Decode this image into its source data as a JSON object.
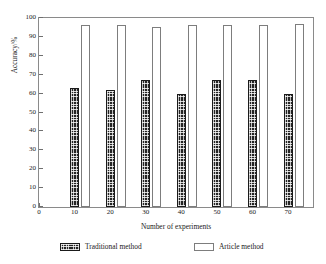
{
  "chart_data": {
    "type": "bar",
    "title": "",
    "subtitle": "",
    "xlabel": "Number of experiments",
    "ylabel": "Accuracy/%",
    "categories": [
      "10",
      "20",
      "30",
      "40",
      "50",
      "60",
      "70"
    ],
    "x": [
      10,
      20,
      30,
      40,
      50,
      60,
      70
    ],
    "series": [
      {
        "name": "Traditional method",
        "values": [
          63,
          62,
          67,
          60,
          67,
          67,
          60
        ],
        "fill": "#242424",
        "pattern": "crosshatch"
      },
      {
        "name": "Article method",
        "values": [
          96.5,
          96.5,
          95.5,
          96.5,
          96.5,
          96.5,
          96.8
        ],
        "fill": "#ffffff",
        "pattern": "open"
      }
    ],
    "xlim": [
      0,
      77
    ],
    "ylim": [
      0,
      100
    ],
    "xticks": [
      0,
      10,
      20,
      30,
      40,
      50,
      60,
      70
    ],
    "xtick_labels": [
      "0",
      "10",
      "20",
      "30",
      "40",
      "50",
      "60",
      "70"
    ],
    "yticks": [
      0,
      10,
      20,
      30,
      40,
      50,
      60,
      70,
      80,
      90,
      100
    ],
    "ytick_labels": [
      "0",
      "10",
      "20",
      "30",
      "40",
      "50",
      "60",
      "70",
      "80",
      "90",
      "100"
    ],
    "grid": false,
    "frame": "box",
    "legend_position": "bottom",
    "legend_entries": [
      "Traditional method",
      "Article method"
    ]
  },
  "axes": {
    "y_title": "Accuracy/%",
    "x_title": "Number of experiments"
  },
  "legend": {
    "traditional_label": "Traditional method",
    "article_label": "Article method"
  },
  "colors": {
    "frame": "#8a8a8a",
    "traditional_bar": "#242424",
    "article_bar": "#ffffff",
    "article_bar_border": "#7d7d7d",
    "text": "#1a1a1a",
    "background": "#ffffff"
  }
}
